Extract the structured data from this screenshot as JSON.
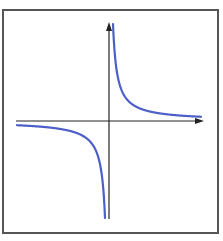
{
  "chart_data": {
    "type": "line",
    "title": "",
    "function": "y = k/x (k > 0)",
    "xlabel": "",
    "ylabel": "",
    "series": [
      {
        "name": "right-branch",
        "quadrant": "I",
        "points_px": "x from 113 to 200, y = 121 - 388/(x-109)"
      },
      {
        "name": "left-branch",
        "quadrant": "III",
        "points_px": "x from 17 to 105, y = 121 - 388/(x-109)"
      }
    ],
    "asymptotes": [
      "x = 0 (vertical axis)",
      "y = 0 (horizontal axis)"
    ],
    "grid": false,
    "tick_labels": false
  },
  "colors": {
    "curve": "#4d5fc8",
    "axes": "#222222",
    "frame": "#555555",
    "background": "#ffffff"
  },
  "geometry": {
    "origin": [
      109,
      121
    ],
    "k": 388,
    "frame": {
      "x": 3,
      "y": 10,
      "w": 215,
      "h": 223
    },
    "x_axis": {
      "x1": 16,
      "x2": 204,
      "y": 121
    },
    "y_axis": {
      "x": 109,
      "y1": 22,
      "y2": 219
    },
    "right_branch_range": [
      113,
      201
    ],
    "left_branch_range": [
      17,
      105
    ]
  }
}
